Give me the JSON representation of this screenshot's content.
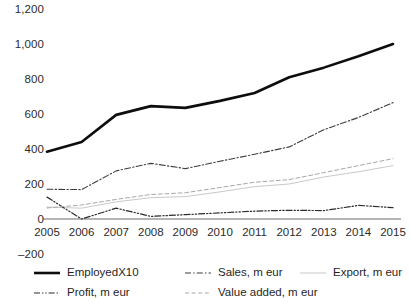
{
  "chart_data": {
    "type": "line",
    "title": "",
    "subtitle": "",
    "xlabel": "",
    "ylabel": "",
    "categories": [
      "2005",
      "2006",
      "2007",
      "2008",
      "2009",
      "2010",
      "2011",
      "2012",
      "2013",
      "2014",
      "2015"
    ],
    "ylim": [
      -200,
      1200
    ],
    "ytick_values": [
      1200,
      1000,
      800,
      600,
      400,
      200,
      0,
      -200
    ],
    "ytick_labels": [
      "1,200",
      "1,000",
      "800",
      "600",
      "400",
      "200",
      "0",
      "–200"
    ],
    "grid": false,
    "legend_position": "bottom",
    "zero_axis_line": true,
    "series": [
      {
        "name": "EmployedX10",
        "style": "solid",
        "width": 2.6,
        "color": "#0d0d0d",
        "values": [
          385,
          440,
          595,
          645,
          635,
          675,
          720,
          810,
          865,
          930,
          1000
        ]
      },
      {
        "name": "Sales, m eur",
        "style": "dash-dot",
        "width": 1.1,
        "color": "#3d3d3d",
        "values": [
          170,
          168,
          275,
          318,
          288,
          330,
          370,
          412,
          510,
          580,
          665
        ]
      },
      {
        "name": "Export, m eur",
        "style": "solid-light",
        "width": 1.0,
        "color": "#c9c9c9",
        "values": [
          68,
          62,
          98,
          122,
          128,
          155,
          185,
          200,
          240,
          270,
          305
        ]
      },
      {
        "name": "Profit, m eur",
        "style": "dash-dot-dot",
        "width": 1.2,
        "color": "#2b2b2b",
        "values": [
          125,
          0,
          62,
          15,
          25,
          35,
          45,
          50,
          48,
          78,
          65
        ]
      },
      {
        "name": "Value added, m eur",
        "style": "dashed",
        "width": 1.0,
        "color": "#a8a8a8",
        "values": [
          63,
          80,
          112,
          140,
          150,
          180,
          210,
          225,
          265,
          305,
          345
        ]
      }
    ]
  },
  "legend": {
    "items": [
      {
        "label": "EmployedX10",
        "series": "EmployedX10"
      },
      {
        "label": "Sales, m eur",
        "series": "Sales, m eur"
      },
      {
        "label": "Export, m eur",
        "series": "Export, m eur"
      },
      {
        "label": "Profit, m eur",
        "series": "Profit, m eur"
      },
      {
        "label": "Value added, m eur",
        "series": "Value added, m eur"
      }
    ]
  },
  "axes": {
    "zero_line_color": "#b5b5b5"
  }
}
